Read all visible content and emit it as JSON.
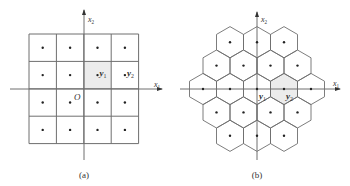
{
  "panels": [
    {
      "id": "a",
      "caption": "(a)",
      "lattice": "square",
      "origin": [
        84,
        89
      ],
      "cell": 27.4,
      "grid": {
        "cols": 4,
        "rows": 4,
        "left": 29,
        "top": 34
      },
      "shaded_cell": {
        "col": 2,
        "row": 1
      },
      "axis_labels": {
        "x": "x",
        "x_sub": "1",
        "y": "x",
        "y_sub": "2",
        "origin": "O"
      },
      "points": [
        {
          "label": "y",
          "sub": "1",
          "col": 2,
          "row": 1
        },
        {
          "label": "y",
          "sub": "2",
          "col": 3,
          "row": 1
        }
      ]
    },
    {
      "id": "b",
      "caption": "(b)",
      "lattice": "hexagonal",
      "origin": [
        257,
        89
      ],
      "spacing_x": 27,
      "spacing_y": 23.4,
      "rows": [
        {
          "dy": -2,
          "offsets": [
            -1,
            0,
            1
          ]
        },
        {
          "dy": -1,
          "offsets": [
            -1.5,
            -0.5,
            0.5,
            1.5
          ]
        },
        {
          "dy": 0,
          "offsets": [
            -2,
            -1,
            0,
            1,
            2
          ]
        },
        {
          "dy": 1,
          "offsets": [
            -1.5,
            -0.5,
            0.5,
            1.5
          ]
        },
        {
          "dy": 2,
          "offsets": [
            -1,
            0,
            1
          ]
        }
      ],
      "shaded_hex": {
        "dy": 0,
        "offset": 1
      },
      "axis_labels": {
        "x": "x",
        "x_sub": "1",
        "y": "x",
        "y_sub": "2"
      },
      "points": [
        {
          "label": "y",
          "sub": "1",
          "dy": 0,
          "offset": 0
        },
        {
          "label": "y",
          "sub": "2",
          "dy": 0,
          "offset": 1
        }
      ]
    }
  ]
}
